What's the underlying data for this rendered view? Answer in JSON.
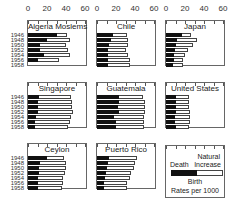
{
  "chart_data": {
    "type": "bar",
    "subtype": "small-multiples horizontal overlaid bars (death rate inside birth rate)",
    "title": "",
    "xlabel": "Rates per 1000",
    "x_ticks": [
      "0",
      "20",
      "40",
      "60"
    ],
    "xlim": [
      0,
      60
    ],
    "categories": [
      "1946",
      "1948",
      "1950",
      "1952",
      "1954",
      "1956",
      "1958"
    ],
    "legend": {
      "dark": "Death",
      "light": "Natural Increase",
      "total": "Birth",
      "units": "Rates per 1000"
    },
    "panels": [
      {
        "name": "Algeria Moslems",
        "death": [
          31,
          20,
          13,
          13,
          17,
          10,
          null
        ],
        "birth": [
          41,
          44,
          40,
          42,
          44,
          33,
          null
        ]
      },
      {
        "name": "Chile",
        "death": [
          17,
          15,
          13,
          12,
          12,
          12,
          12
        ],
        "birth": [
          32,
          33,
          33,
          31,
          33,
          35,
          35
        ]
      },
      {
        "name": "Japan",
        "death": [
          17,
          12,
          11,
          9,
          8,
          8,
          7
        ],
        "birth": [
          26,
          33,
          28,
          23,
          20,
          18,
          18
        ]
      },
      {
        "name": "Singapore",
        "death": [
          12,
          11,
          10,
          10,
          8,
          7,
          7
        ],
        "birth": [
          45,
          46,
          46,
          47,
          45,
          44,
          42
        ]
      },
      {
        "name": "Guatemala",
        "death": [
          23,
          23,
          22,
          23,
          18,
          20,
          20
        ],
        "birth": [
          48,
          50,
          51,
          51,
          49,
          49,
          49
        ]
      },
      {
        "name": "United States",
        "death": [
          10,
          10,
          10,
          10,
          9,
          9,
          10
        ],
        "birth": [
          24,
          24,
          24,
          25,
          25,
          25,
          24
        ]
      },
      {
        "name": "Ceylon",
        "death": [
          20,
          13,
          12,
          12,
          11,
          10,
          10
        ],
        "birth": [
          38,
          40,
          40,
          39,
          37,
          37,
          36
        ]
      },
      {
        "name": "Puerto Rico",
        "death": [
          13,
          12,
          10,
          9,
          8,
          7,
          7
        ],
        "birth": [
          42,
          40,
          39,
          36,
          35,
          32,
          32
        ]
      }
    ]
  },
  "axis": {
    "ticks": [
      "0",
      "20",
      "40",
      "60"
    ]
  },
  "years": [
    "1946",
    "1948",
    "1950",
    "1952",
    "1954",
    "1956",
    "1958"
  ],
  "panels": [
    {
      "title": "Algeria Moslems"
    },
    {
      "title": "Chile"
    },
    {
      "title": "Japan"
    },
    {
      "title": "Singapore"
    },
    {
      "title": "Guatemala"
    },
    {
      "title": "United States"
    },
    {
      "title": "Ceylon"
    },
    {
      "title": "Puerto Rico"
    }
  ],
  "legend": {
    "death": "Death",
    "natural_line1": "Natural",
    "natural_line2": "Increase",
    "birth": "Birth",
    "units": "Rates per 1000"
  }
}
